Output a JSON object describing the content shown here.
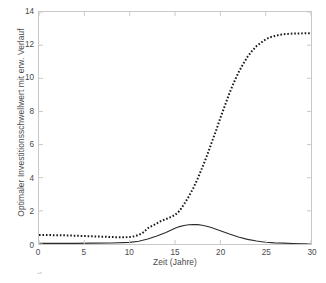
{
  "figure": {
    "background_color": "#ffffff",
    "axis_color": "#c8c8c8",
    "text_color": "#4a4a4a",
    "caption_fragment": "Abbildung"
  },
  "chart_data": {
    "type": "line",
    "title": "",
    "xlabel": "Zeit (Jahre)",
    "ylabel": "Optimaler Investitionsschwellwert mit erw. Verlauf",
    "xlim": [
      0,
      30
    ],
    "ylim": [
      0,
      14
    ],
    "xticks": [
      0,
      5,
      10,
      15,
      20,
      25,
      30
    ],
    "yticks": [
      0,
      2,
      4,
      6,
      8,
      10,
      12,
      14
    ],
    "grid": false,
    "legend": "none",
    "series": [
      {
        "name": "Optimaler Investitionsschwellwert",
        "style": "dotted",
        "color": "#1a1a1a",
        "x": [
          0,
          1,
          2,
          3,
          4,
          5,
          6,
          7,
          8,
          9,
          10,
          10.5,
          11,
          11.5,
          12,
          12.5,
          13,
          13.5,
          14,
          14.5,
          15,
          15.5,
          16,
          16.5,
          17,
          17.5,
          18,
          18.5,
          19,
          19.5,
          20,
          20.5,
          21,
          21.5,
          22,
          22.5,
          23,
          23.5,
          24,
          24.5,
          25,
          25.5,
          26,
          26.5,
          27,
          27.5,
          28,
          28.5,
          29,
          29.5,
          30
        ],
        "y": [
          0.55,
          0.54,
          0.53,
          0.52,
          0.5,
          0.48,
          0.46,
          0.44,
          0.42,
          0.4,
          0.42,
          0.46,
          0.55,
          0.7,
          0.95,
          1.1,
          1.25,
          1.4,
          1.5,
          1.62,
          1.75,
          2.0,
          2.4,
          2.85,
          3.35,
          3.95,
          4.6,
          5.3,
          6.05,
          6.8,
          7.6,
          8.35,
          9.1,
          9.75,
          10.35,
          10.85,
          11.3,
          11.65,
          11.95,
          12.15,
          12.35,
          12.48,
          12.55,
          12.62,
          12.66,
          12.68,
          12.7,
          12.7,
          12.71,
          12.72,
          12.72
        ]
      },
      {
        "name": "Erwarteter Verlauf",
        "style": "solid",
        "color": "#2b2b2b",
        "x": [
          0,
          2,
          4,
          6,
          8,
          10,
          11,
          12,
          13,
          14,
          15,
          15.5,
          16,
          16.5,
          17,
          17.5,
          18,
          18.5,
          19,
          20,
          21,
          22,
          23,
          24,
          25,
          26,
          27,
          28,
          29,
          30
        ],
        "y": [
          0.04,
          0.04,
          0.04,
          0.05,
          0.06,
          0.1,
          0.17,
          0.3,
          0.48,
          0.7,
          0.95,
          1.05,
          1.12,
          1.16,
          1.18,
          1.17,
          1.13,
          1.07,
          0.99,
          0.8,
          0.6,
          0.42,
          0.28,
          0.18,
          0.11,
          0.07,
          0.05,
          0.03,
          0.02,
          0.02
        ]
      }
    ]
  }
}
